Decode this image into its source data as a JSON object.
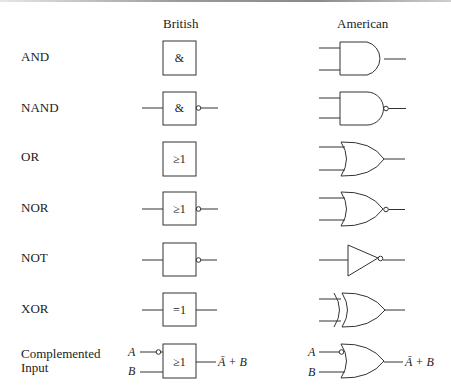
{
  "columns": {
    "british": "British",
    "american": "American"
  },
  "rows": [
    {
      "label": "AND",
      "british_symbol": "&"
    },
    {
      "label": "NAND",
      "british_symbol": "&"
    },
    {
      "label": "OR",
      "british_symbol": "≥1"
    },
    {
      "label": "NOR",
      "british_symbol": "≥1"
    },
    {
      "label": "NOT",
      "british_symbol": ""
    },
    {
      "label": "XOR",
      "british_symbol": "=1"
    },
    {
      "label_line1": "Complemented",
      "label_line2": "Input",
      "british_symbol": "≥1",
      "input_a": "A",
      "input_b": "B",
      "output_expr": "Ā + B"
    }
  ],
  "colors": {
    "line": "#333333",
    "text": "#222222"
  }
}
